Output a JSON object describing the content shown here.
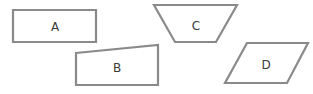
{
  "diagram": {
    "stroke_color": "#8a8a8a",
    "label_color": "#3a3a3a",
    "shapes": [
      {
        "id": "A",
        "label": "A",
        "type": "rectangle",
        "points": "13,10 96,10 96,42 13,42",
        "label_pos": [
          55,
          27
        ]
      },
      {
        "id": "B",
        "label": "B",
        "type": "quadrilateral",
        "points": "76,53 158,45 158,85 76,85",
        "label_pos": [
          117,
          68
        ]
      },
      {
        "id": "C",
        "label": "C",
        "type": "trapezoid",
        "points": "154,5 237,5 216,42 175,42",
        "label_pos": [
          196,
          26
        ]
      },
      {
        "id": "D",
        "label": "D",
        "type": "parallelogram",
        "points": "247,43 308,43 287,83 225,83",
        "label_pos": [
          266,
          65
        ]
      }
    ]
  }
}
